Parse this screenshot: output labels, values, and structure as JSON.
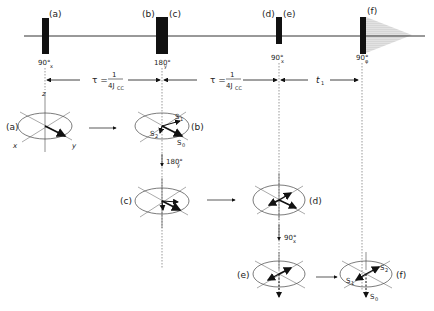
{
  "pulse_sequence": {
    "pulse_labels": [
      "(a)",
      "(b)",
      "(c)",
      "(d)",
      "(e)",
      "(f)"
    ],
    "pulses": [
      {
        "angle": "90°",
        "phase": "x"
      },
      {
        "angle": "180°",
        "phase": "y"
      },
      {
        "angle": "90°",
        "phase": "x"
      },
      {
        "angle": "90°",
        "phase": "φ"
      }
    ],
    "delays": [
      {
        "symbol": "τ =",
        "numerator": "1",
        "denominator": "4J",
        "denominator_sub": "CC"
      },
      {
        "symbol": "τ =",
        "numerator": "1",
        "denominator": "4J",
        "denominator_sub": "CC"
      },
      {
        "symbol": "t",
        "sub": "1"
      }
    ]
  },
  "vector_diagrams": {
    "axes": {
      "z": "z",
      "x": "x",
      "y": "y"
    },
    "labels": {
      "a": "(a)",
      "b": "(b)",
      "c": "(c)",
      "d": "(d)",
      "e": "(e)",
      "f": "(f)"
    },
    "b_vectors": {
      "s1": "S",
      "s1_sub": "1",
      "s2": "S",
      "s2_sub": "2",
      "s0": "S",
      "s0_sub": "0"
    },
    "f_vectors": {
      "s1": "S",
      "s1_sub": "1",
      "s2": "S",
      "s2_sub": "2",
      "s0": "S",
      "s0_sub": "0"
    },
    "transitions": [
      {
        "angle": "180°",
        "phase": "y"
      },
      {
        "angle": "90°",
        "phase": "x"
      }
    ]
  }
}
